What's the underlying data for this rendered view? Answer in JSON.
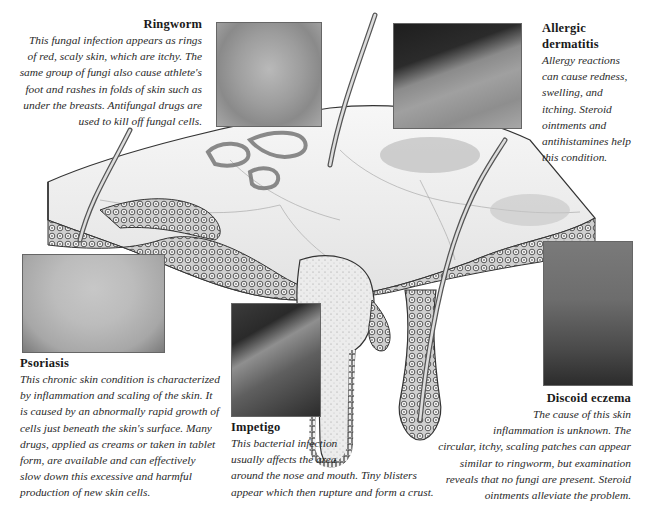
{
  "figure": {
    "sections": [
      {
        "id": "ringworm",
        "title": "Ringworm",
        "lines": [
          "This fungal infection appears as rings",
          "of red, scaly skin, which are itchy. The",
          "same group of fungi also cause athlete's",
          "foot and rashes in folds of skin such as",
          "under the breasts. Antifungal drugs are",
          "used to kill off fungal cells."
        ],
        "photo_label": "ringworm-photo"
      },
      {
        "id": "allergic-dermatitis",
        "title_lines": [
          "Allergic",
          "dermatitis"
        ],
        "lines": [
          "Allergy reactions",
          "can cause redness,",
          "swelling, and",
          "itching. Steroid",
          "ointments and",
          "antihistamines help",
          "this condition."
        ],
        "photo_label": "allergic-dermatitis-photo"
      },
      {
        "id": "psoriasis",
        "title": "Psoriasis",
        "lines": [
          "This chronic skin condition is characterized",
          "by inflammation and scaling of the skin. It",
          "is caused by an abnormally rapid growth of",
          "cells just beneath the skin's surface. Many",
          "drugs, applied as creams or taken in tablet",
          "form, are available and can effectively",
          "slow down this excessive and harmful",
          "production of new skin cells."
        ],
        "photo_label": "psoriasis-photo"
      },
      {
        "id": "impetigo",
        "title": "Impetigo",
        "lines": [
          "This bacterial infection",
          "usually affects the area",
          "around the nose and mouth. Tiny blisters",
          "appear which then rupture and form a crust."
        ],
        "photo_label": "impetigo-photo"
      },
      {
        "id": "discoid-eczema",
        "title": "Discoid eczema",
        "lines": [
          "The cause of this skin",
          "inflammation is unknown. The",
          "circular, itchy, scaling patches can appear",
          "similar to ringworm, but examination",
          "reveals that no fungi are present. Steroid",
          "ointments alleviate the problem."
        ],
        "photo_label": "discoid-eczema-photo"
      }
    ],
    "colors": {
      "ink": "#222222",
      "skin_surface": "#efefef",
      "cell_fill": "#d8d8d8",
      "photo_dark": "#3a3a3a"
    }
  }
}
